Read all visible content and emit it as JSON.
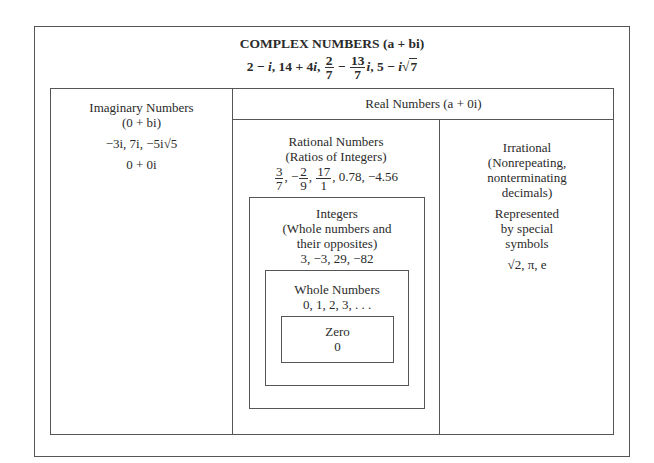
{
  "complex": {
    "title": "COMPLEX NUMBERS (a + bi)",
    "examples": {
      "e1": "2 − ",
      "e1i": "i",
      "e2": ", 14 + 4",
      "e2i": "i",
      "sep": ",",
      "f1_num": "2",
      "f1_den": "7",
      "minus": "−",
      "f2_num": "13",
      "f2_den": "7",
      "f2i": "i",
      "e3": ", 5 − ",
      "e3i": "i",
      "e3root": "√",
      "e3rad": "7"
    }
  },
  "imaginary": {
    "title": "Imaginary Numbers",
    "form": "(0 + bi)",
    "examples": "−3i, 7i, −5i√5",
    "zero": "0 + 0i"
  },
  "real": {
    "title": "Real Numbers (a + 0i)"
  },
  "rational": {
    "title": "Rational Numbers",
    "subtitle": "(Ratios of Integers)",
    "fractions": [
      {
        "num": "3",
        "den": "7",
        "sign": ""
      },
      {
        "num": "2",
        "den": "9",
        "sign": "−"
      },
      {
        "num": "17",
        "den": "1",
        "sign": ""
      }
    ],
    "decimals": ", 0.78, −4.56"
  },
  "irrational": {
    "line1": "Irrational",
    "line2": "(Nonrepeating,",
    "line3": "nonterminating",
    "line4": "decimals)",
    "line5": "Represented",
    "line6": "by special",
    "line7": "symbols",
    "examples": "√2, π, e"
  },
  "integers": {
    "line1": "Integers",
    "line2": "(Whole numbers and",
    "line3": "their opposites)",
    "examples": "3, −3, 29, −82"
  },
  "whole": {
    "title": "Whole Numbers",
    "examples": "0, 1, 2, 3, . . ."
  },
  "zero": {
    "title": "Zero",
    "value": "0"
  }
}
